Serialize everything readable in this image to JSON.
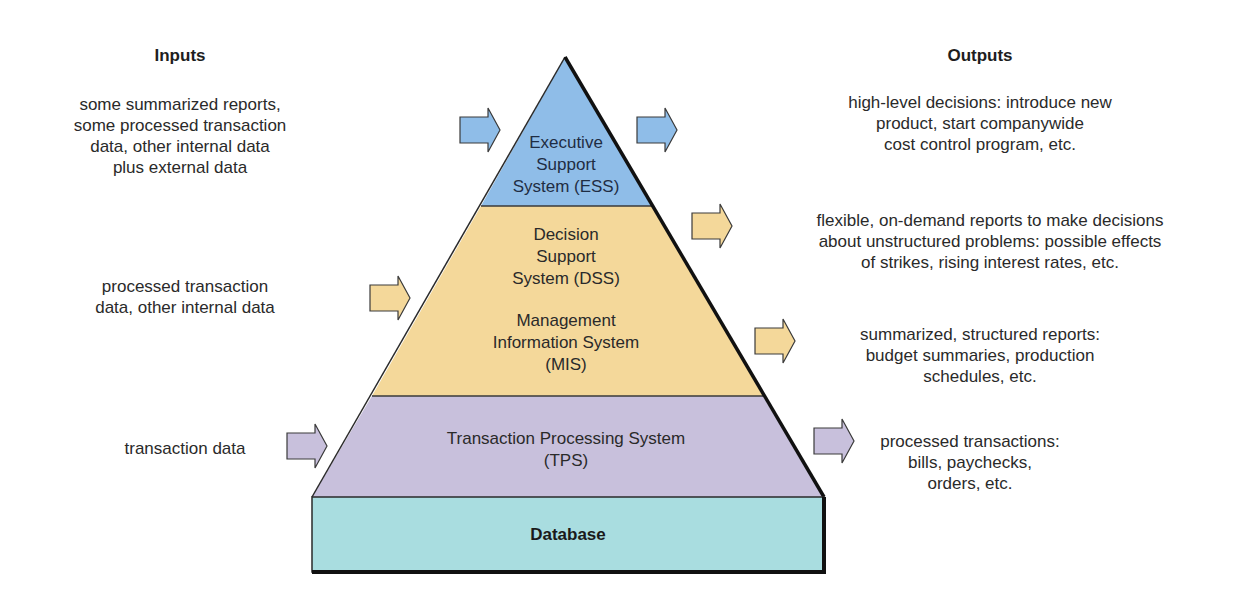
{
  "headings": {
    "inputs": "Inputs",
    "outputs": "Outputs"
  },
  "colors": {
    "ess": "#8fbde8",
    "dss_mis": "#f4d89a",
    "tps": "#c8c0dc",
    "database": "#a9dde0",
    "outline": "#1a1a1a"
  },
  "layers": {
    "ess": {
      "lines": [
        "Executive",
        "Support",
        "System (ESS)"
      ]
    },
    "dss": {
      "lines": [
        "Decision",
        "Support",
        "System (DSS)"
      ]
    },
    "mis": {
      "lines": [
        "Management",
        "Information System",
        "(MIS)"
      ]
    },
    "tps": {
      "lines": [
        "Transaction Processing System",
        "(TPS)"
      ]
    },
    "database": {
      "label": "Database"
    }
  },
  "inputs": [
    {
      "target": "ESS",
      "lines": [
        "some summarized reports,",
        "some processed transaction",
        "data, other internal data",
        "plus external data"
      ]
    },
    {
      "target": "DSS/MIS",
      "lines": [
        "processed transaction",
        "data, other internal data"
      ]
    },
    {
      "target": "TPS",
      "lines": [
        "transaction data"
      ]
    }
  ],
  "outputs": [
    {
      "source": "ESS",
      "lines": [
        "high-level decisions: introduce new",
        "product, start companywide",
        "cost control program, etc."
      ]
    },
    {
      "source": "DSS",
      "lines": [
        "flexible, on-demand reports to make decisions",
        "about unstructured problems: possible effects",
        "of strikes, rising interest rates, etc."
      ]
    },
    {
      "source": "MIS",
      "lines": [
        "summarized, structured reports:",
        "budget summaries, production",
        "schedules, etc."
      ]
    },
    {
      "source": "TPS",
      "lines": [
        "processed transactions:",
        "bills, paychecks,",
        "orders, etc."
      ]
    }
  ]
}
